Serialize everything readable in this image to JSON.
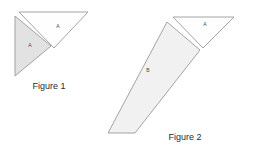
{
  "canvas": {
    "width": 277,
    "height": 155,
    "background_color": "#ffffff"
  },
  "colors": {
    "shaded_fill": "#e2e2e2",
    "light_fill": "#f1f1f1",
    "white_fill": "#fefefe",
    "stroke": "#9a9a9a",
    "label_text": "#4a4a4a",
    "caption_text": "#2b2b2b"
  },
  "figure1": {
    "caption": "Figure 1",
    "caption_position": {
      "x": 49,
      "y": 87
    },
    "shapes": [
      {
        "name": "shaded-triangle-a",
        "label": "A",
        "label_position": {
          "x": 30,
          "y": 46
        },
        "points": "15,16 15,76 51,46",
        "fill": "#e2e2e2",
        "stroke": "#9a9a9a"
      },
      {
        "name": "white-triangle-a",
        "label": "A",
        "label_position": {
          "x": 58,
          "y": 27
        },
        "points": "19,12 88,12 54,48",
        "fill": "#fefefe",
        "stroke": "#9a9a9a"
      }
    ]
  },
  "figure2": {
    "caption": "Figure 2",
    "caption_position": {
      "x": 185,
      "y": 138
    },
    "shapes": [
      {
        "name": "parallelogram-b",
        "label": "B",
        "label_position": {
          "x": 148,
          "y": 71
        },
        "points": "167,22 200,50 135,133 108,133",
        "fill": "#f1f1f1",
        "stroke": "#9a9a9a"
      },
      {
        "name": "white-triangle-a",
        "label": "A",
        "label_position": {
          "x": 205,
          "y": 25
        },
        "points": "173,17 234,17 203,48",
        "fill": "#fefefe",
        "stroke": "#9a9a9a"
      }
    ]
  }
}
